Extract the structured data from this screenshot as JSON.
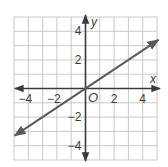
{
  "chart_data": {
    "type": "line",
    "title": "",
    "xlabel": "x",
    "ylabel": "y",
    "origin_label": "O",
    "xlim": [
      -5,
      5
    ],
    "ylim": [
      -5,
      5
    ],
    "grid": true,
    "grid_step": 1,
    "x_ticks": [
      -4,
      -2,
      2,
      4
    ],
    "y_ticks": [
      4,
      2,
      -2,
      -4
    ],
    "x_tick_labels": [
      "−4",
      "−2",
      "2",
      "4"
    ],
    "y_tick_labels": [
      "4",
      "2",
      "−2",
      "−4"
    ],
    "series": [
      {
        "name": "line",
        "equation": "y = (2/3)x",
        "slope": 0.6667,
        "intercept": 0,
        "x": [
          -5,
          5
        ],
        "y": [
          -3.33,
          3.33
        ],
        "arrows": "both",
        "color": "#5a5a5a"
      }
    ]
  },
  "colors": {
    "grid": "#c8c8c8",
    "axis": "#3a3a3a",
    "line": "#5a5a5a",
    "background": "#ffffff"
  }
}
